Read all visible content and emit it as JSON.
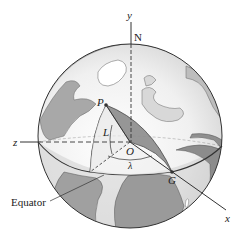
{
  "figure": {
    "type": "globe-coordinate-diagram",
    "labels": {
      "y_axis": "y",
      "z_axis": "z",
      "x_axis": "x",
      "north": "N",
      "point_p": "P",
      "origin": "O",
      "point_g": "G",
      "latitude": "L",
      "longitude": "λ",
      "equator": "Equator"
    },
    "colors": {
      "ocean": "#f2f2f2",
      "land": "#9a9a9a",
      "land_dark": "#7d7d7d",
      "shade": "#b5b5b5",
      "lines": "#333333",
      "wedge": "#8c8c8c"
    }
  }
}
